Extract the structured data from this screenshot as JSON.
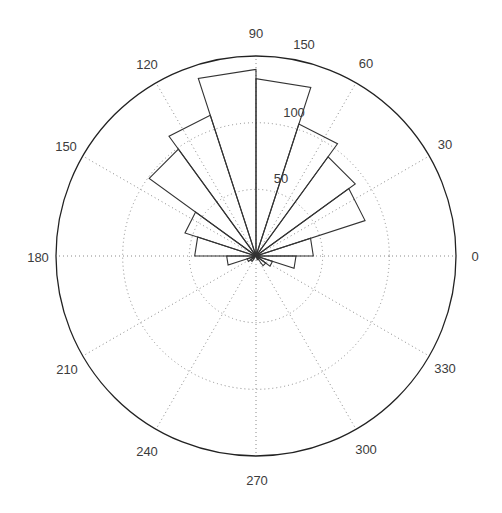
{
  "chart_data": {
    "type": "rose",
    "title": "",
    "xlabel": "",
    "ylabel": "",
    "center": [
      256,
      256
    ],
    "radius_px": 200,
    "rmax": 150,
    "radial_ticks": [
      50,
      100,
      150
    ],
    "radial_tick_labels": [
      "50",
      "100",
      "150"
    ],
    "radial_label_angle_deg": 75,
    "angular_ticks_deg": [
      0,
      30,
      60,
      90,
      120,
      150,
      180,
      210,
      240,
      270,
      300,
      330
    ],
    "angular_tick_labels": [
      "0",
      "30",
      "60",
      "90",
      "120",
      "150",
      "180",
      "210",
      "240",
      "270",
      "300",
      "330"
    ],
    "bin_width_deg": 18,
    "bin_edges_deg": [
      0,
      18,
      36,
      54,
      72,
      90,
      108,
      126,
      144,
      162,
      180,
      198,
      216,
      234,
      252,
      270,
      288,
      306,
      324,
      342,
      360
    ],
    "values": [
      43,
      86,
      92,
      104,
      133,
      140,
      111,
      99,
      56,
      46,
      22,
      7,
      5,
      0,
      0,
      0,
      3,
      9,
      13,
      30
    ],
    "grid": true,
    "colors": {
      "bar_edge": "#333333",
      "grid": "#8a8a8a",
      "axis_circle": "#222222",
      "text": "#3c3c3c"
    }
  },
  "labels": {
    "angular": [
      {
        "text": "0",
        "x": 475,
        "y": 256
      },
      {
        "text": "30",
        "x": 445,
        "y": 144
      },
      {
        "text": "60",
        "x": 366,
        "y": 63
      },
      {
        "text": "90",
        "x": 256,
        "y": 33
      },
      {
        "text": "120",
        "x": 147,
        "y": 64
      },
      {
        "text": "150",
        "x": 66,
        "y": 146
      },
      {
        "text": "180",
        "x": 38,
        "y": 257
      },
      {
        "text": "210",
        "x": 67,
        "y": 369
      },
      {
        "text": "240",
        "x": 147,
        "y": 451
      },
      {
        "text": "270",
        "x": 257,
        "y": 480
      },
      {
        "text": "300",
        "x": 366,
        "y": 449
      },
      {
        "text": "330",
        "x": 445,
        "y": 368
      }
    ],
    "radial": [
      {
        "text": "50",
        "x": 281,
        "y": 178
      },
      {
        "text": "100",
        "x": 294,
        "y": 112
      },
      {
        "text": "150",
        "x": 304,
        "y": 44
      }
    ]
  }
}
